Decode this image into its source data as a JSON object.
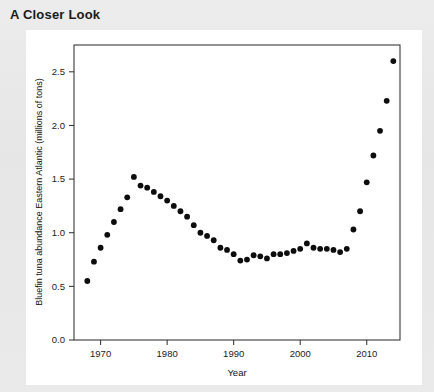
{
  "panel": {
    "title": "A Closer Look"
  },
  "chart_data": {
    "type": "scatter",
    "title": "",
    "xlabel": "Year",
    "ylabel": "Bluefin tuna abundance Eastern Atlantic (millions of tons)",
    "xlim": [
      1966,
      2015
    ],
    "ylim": [
      0.0,
      2.75
    ],
    "xticks": [
      1970,
      1980,
      1990,
      2000,
      2010
    ],
    "xtick_labels": [
      "1970",
      "1980",
      "1990",
      "2000",
      "2010"
    ],
    "yticks": [
      0.0,
      0.5,
      1.0,
      1.5,
      2.0,
      2.5
    ],
    "ytick_labels": [
      "0.0",
      "0.5",
      "1.0",
      "1.5",
      "2.0",
      "2.5"
    ],
    "grid": false,
    "legend": "none",
    "marker_color": "#0d0d0d",
    "x": [
      1968,
      1969,
      1970,
      1971,
      1972,
      1973,
      1974,
      1975,
      1976,
      1977,
      1978,
      1979,
      1980,
      1981,
      1982,
      1983,
      1984,
      1985,
      1986,
      1987,
      1988,
      1989,
      1990,
      1991,
      1992,
      1993,
      1994,
      1995,
      1996,
      1997,
      1998,
      1999,
      2000,
      2001,
      2002,
      2003,
      2004,
      2005,
      2006,
      2007,
      2008,
      2009,
      2010,
      2011,
      2012,
      2013,
      2014
    ],
    "y": [
      0.55,
      0.73,
      0.86,
      0.98,
      1.1,
      1.22,
      1.33,
      1.52,
      1.44,
      1.42,
      1.38,
      1.34,
      1.3,
      1.25,
      1.2,
      1.15,
      1.07,
      1.0,
      0.97,
      0.93,
      0.86,
      0.84,
      0.8,
      0.74,
      0.75,
      0.79,
      0.78,
      0.76,
      0.8,
      0.8,
      0.81,
      0.83,
      0.85,
      0.9,
      0.86,
      0.85,
      0.85,
      0.84,
      0.82,
      0.85,
      1.03,
      1.2,
      1.47,
      1.72,
      1.95,
      2.23,
      2.6
    ]
  }
}
